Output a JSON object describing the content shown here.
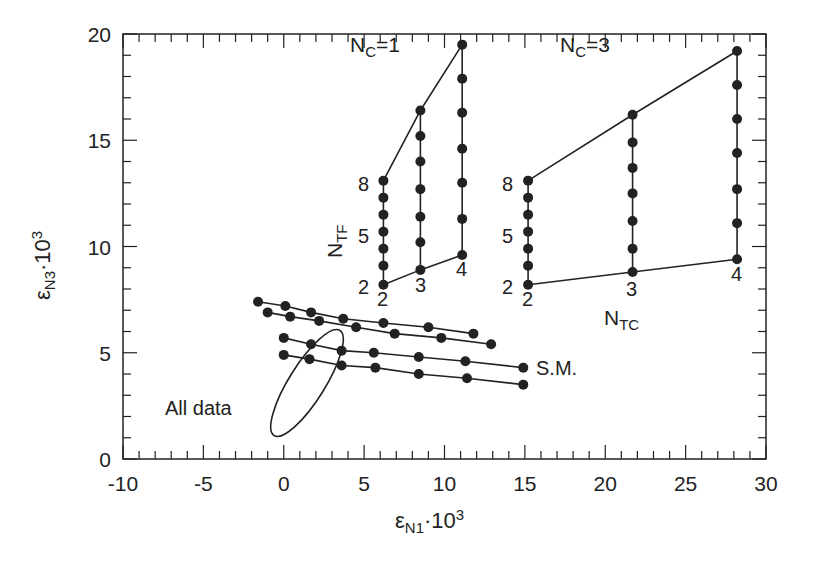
{
  "chart_data": {
    "type": "scatter",
    "title": "",
    "xlabel": "εN1·10³",
    "ylabel": "εN3·10³",
    "xlabel_main": "ε",
    "xlabel_sub": "N1",
    "xlabel_suffix": "·10",
    "xlabel_sup": "3",
    "ylabel_main": "ε",
    "ylabel_sub": "N3",
    "ylabel_suffix": "·10",
    "ylabel_sup": "3",
    "xlim": [
      -10,
      30
    ],
    "ylim": [
      0,
      20
    ],
    "xticks": [
      "-10",
      "-5",
      "0",
      "5",
      "10",
      "15",
      "20",
      "25",
      "30"
    ],
    "yticks": [
      "0",
      "5",
      "10",
      "15",
      "20"
    ],
    "grid": false,
    "annotations": {
      "nc1": {
        "main": "N",
        "sub": "C",
        "rest": "=1"
      },
      "nc3": {
        "main": "N",
        "sub": "C",
        "rest": "=3"
      },
      "ntf": {
        "main": "N",
        "sub": "TF"
      },
      "ntc": {
        "main": "N",
        "sub": "TC"
      },
      "sm": "S.M.",
      "all_data": "All data",
      "ntf_labels": [
        "8",
        "5",
        "2"
      ],
      "nc3_ntf_labels": [
        "8",
        "5",
        "2"
      ],
      "ntc_labels_nc1": [
        "2",
        "3",
        "4"
      ],
      "ntc_labels_nc3": [
        "2",
        "3",
        "4"
      ]
    },
    "series": [
      {
        "name": "NC=1 NTC=2",
        "x": [
          6.2,
          6.2,
          6.2,
          6.2,
          6.2,
          6.2,
          6.2
        ],
        "y": [
          13.1,
          12.3,
          11.5,
          10.7,
          9.9,
          9.1,
          8.2
        ]
      },
      {
        "name": "NC=1 NTC=3",
        "x": [
          8.5,
          8.5,
          8.5,
          8.5,
          8.5,
          8.5,
          8.5
        ],
        "y": [
          16.4,
          15.2,
          14.0,
          12.7,
          11.4,
          10.2,
          8.9
        ]
      },
      {
        "name": "NC=1 NTC=4",
        "x": [
          11.1,
          11.1,
          11.1,
          11.1,
          11.1,
          11.1,
          11.1
        ],
        "y": [
          19.5,
          17.9,
          16.3,
          14.6,
          13.0,
          11.3,
          9.6
        ]
      },
      {
        "name": "NC=3 NTC=2",
        "x": [
          15.2,
          15.2,
          15.2,
          15.2,
          15.2,
          15.2,
          15.2
        ],
        "y": [
          13.1,
          12.3,
          11.5,
          10.7,
          9.9,
          9.1,
          8.2
        ]
      },
      {
        "name": "NC=3 NTC=3",
        "x": [
          21.7,
          21.7,
          21.7,
          21.7,
          21.7,
          21.7,
          21.7
        ],
        "y": [
          16.2,
          14.9,
          13.7,
          12.5,
          11.2,
          9.9,
          8.8
        ]
      },
      {
        "name": "NC=3 NTC=4",
        "x": [
          28.2,
          28.2,
          28.2,
          28.2,
          28.2,
          28.2,
          28.2
        ],
        "y": [
          19.2,
          17.6,
          16.0,
          14.4,
          12.7,
          11.1,
          9.4
        ]
      },
      {
        "name": "line A",
        "x": [
          -1.6,
          0.1,
          1.7,
          3.7,
          6.2,
          9.0,
          11.8
        ],
        "y": [
          7.4,
          7.2,
          6.9,
          6.6,
          6.4,
          6.2,
          5.9
        ]
      },
      {
        "name": "line B",
        "x": [
          -1.0,
          0.4,
          2.2,
          4.5,
          6.9,
          9.8,
          12.9
        ],
        "y": [
          6.9,
          6.7,
          6.5,
          6.2,
          5.9,
          5.7,
          5.4
        ]
      },
      {
        "name": "S.M. upper",
        "x": [
          0,
          1.7,
          3.6,
          5.6,
          8.4,
          11.3,
          14.9
        ],
        "y": [
          5.7,
          5.4,
          5.1,
          5.0,
          4.8,
          4.6,
          4.3
        ]
      },
      {
        "name": "S.M. lower",
        "x": [
          0,
          1.6,
          3.6,
          5.7,
          8.4,
          11.4,
          14.9
        ],
        "y": [
          4.9,
          4.7,
          4.4,
          4.3,
          4.0,
          3.8,
          3.5
        ]
      }
    ],
    "ellipse": {
      "name": "All data",
      "cx": 1.5,
      "cy": 3.5,
      "rx_px": 60,
      "ry_px": 16,
      "angle_deg": -57
    },
    "colors": {
      "ink": "#222222",
      "background": "#ffffff"
    }
  }
}
